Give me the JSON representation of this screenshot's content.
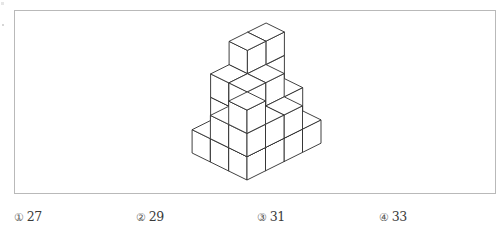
{
  "question": {
    "figure": {
      "description": "isometric stack of unit cubes",
      "line_color": "#2b2b2b",
      "frame_color": "#b9b9b9",
      "heights_rows_front_to_back": [
        [
          3,
          2,
          2,
          1
        ],
        [
          2,
          3,
          3,
          2
        ],
        [
          1,
          3,
          4,
          4
        ]
      ]
    },
    "choices": [
      {
        "marker": "①",
        "value": "27"
      },
      {
        "marker": "②",
        "value": "29"
      },
      {
        "marker": "③",
        "value": "31"
      },
      {
        "marker": "④",
        "value": "33"
      }
    ]
  }
}
